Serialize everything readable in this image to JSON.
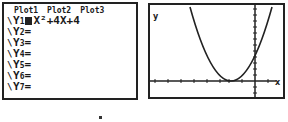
{
  "y_editor": {
    "plots": [
      "Plot1",
      "Plot2",
      "Plot3"
    ],
    "functions": [
      {
        "label": "Y",
        "index": "1",
        "equals": "=",
        "expr": "X²+4X+4",
        "selected": true
      },
      {
        "label": "Y",
        "index": "2",
        "equals": "=",
        "expr": ""
      },
      {
        "label": "Y",
        "index": "3",
        "equals": "=",
        "expr": ""
      },
      {
        "label": "Y",
        "index": "4",
        "equals": "=",
        "expr": ""
      },
      {
        "label": "Y",
        "index": "5",
        "equals": "=",
        "expr": ""
      },
      {
        "label": "Y",
        "index": "6",
        "equals": "=",
        "expr": ""
      },
      {
        "label": "Y",
        "index": "7",
        "equals": "=",
        "expr": ""
      }
    ]
  },
  "graph": {
    "y_axis_label": "y",
    "x_axis_label": "x",
    "function": "y = x^2 + 4x + 4",
    "vertex": [
      -2,
      0
    ],
    "y_intercept": 4
  },
  "colors": {
    "ink": "#222222",
    "background": "#ffffff"
  }
}
